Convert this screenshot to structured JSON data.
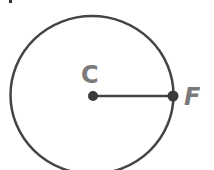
{
  "diagram": {
    "type": "circle-radius",
    "points": [
      {
        "label": "C",
        "role": "center"
      },
      {
        "label": "F",
        "role": "point-on-circle"
      }
    ],
    "segment": "CF",
    "colors": {
      "stroke": "#444444",
      "label": "#7a7a7a",
      "background": "#ffffff"
    }
  }
}
